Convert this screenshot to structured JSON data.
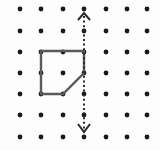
{
  "figure": {
    "background_color": "#fdfdfd",
    "width": 160,
    "height": 150,
    "grid": {
      "name": "square-dot-lattice",
      "columns": 7,
      "rows": 7,
      "x_positions": [
        20,
        41,
        63,
        84,
        106,
        127,
        147
      ],
      "y_positions": [
        9,
        31,
        52,
        73,
        94,
        115,
        137
      ],
      "dot_radius": 2.4,
      "dot_color": "#1a1a1a",
      "spacing_px": 21.4
    },
    "shape": {
      "name": "pentagon",
      "label": "shape",
      "stroke_color": "#5a5a5a",
      "stroke_width": 2.4,
      "fill": "none",
      "closed": true,
      "vertex_count": 5,
      "vertices": [
        {
          "name": "top-left",
          "x": 41,
          "y": 51,
          "grid_col": 1,
          "grid_row": 2
        },
        {
          "name": "top-right",
          "x": 84,
          "y": 51,
          "grid_col": 3,
          "grid_row": 2
        },
        {
          "name": "right",
          "x": 84,
          "y": 73,
          "grid_col": 3,
          "grid_row": 3
        },
        {
          "name": "bottom-right",
          "x": 63,
          "y": 94,
          "grid_col": 2,
          "grid_row": 4
        },
        {
          "name": "bottom-left",
          "x": 41,
          "y": 94,
          "grid_col": 1,
          "grid_row": 4
        }
      ],
      "path_d": "M 41 51 L 84 51 L 84 73 L 63 94 L 41 94 Z"
    },
    "mirror_line": {
      "name": "vertical-dashed-mirror-line",
      "orientation": "vertical",
      "x": 84,
      "y_start": 16,
      "y_end": 130,
      "grid_column": 3,
      "stroke_color": "#2b2b2b",
      "stroke_width": 2,
      "dash_pattern": "2 2.6",
      "arrowheads": "both",
      "arrow_top": {
        "name": "arrow-head-up",
        "direction": "up",
        "apex_x": 84,
        "apex_y": 13,
        "points": "78,20 84,13 90,20"
      },
      "arrow_bottom": {
        "name": "arrow-head-down",
        "direction": "down",
        "apex_x": 84,
        "apex_y": 132,
        "points": "78,124 84,132 90,124"
      }
    }
  }
}
